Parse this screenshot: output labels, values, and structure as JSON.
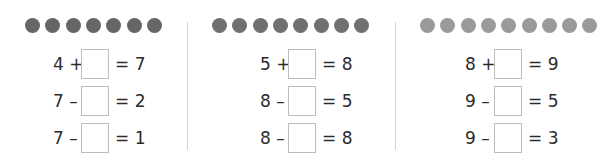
{
  "groups": [
    {
      "dot_count": 7,
      "dot_color": "#666666",
      "equations": [
        {
          "left": "4 +",
          "answer": "",
          "right": "= 7"
        },
        {
          "left": "7 –",
          "answer": "",
          "right": "= 2"
        },
        {
          "left": "7 –",
          "answer": "",
          "right": "= 1"
        }
      ]
    },
    {
      "dot_count": 8,
      "dot_color": "#707070",
      "equations": [
        {
          "left": "5 +",
          "answer": "",
          "right": "= 8"
        },
        {
          "left": "8 –",
          "answer": "",
          "right": "= 5"
        },
        {
          "left": "8 –",
          "answer": "",
          "right": "= 8"
        }
      ]
    },
    {
      "dot_count": 9,
      "dot_color": "#9a9a9a",
      "equations": [
        {
          "left": "8 +",
          "answer": "",
          "right": "= 9"
        },
        {
          "left": "9 –",
          "answer": "",
          "right": "= 5"
        },
        {
          "left": "9 –",
          "answer": "",
          "right": "= 3"
        }
      ]
    }
  ]
}
